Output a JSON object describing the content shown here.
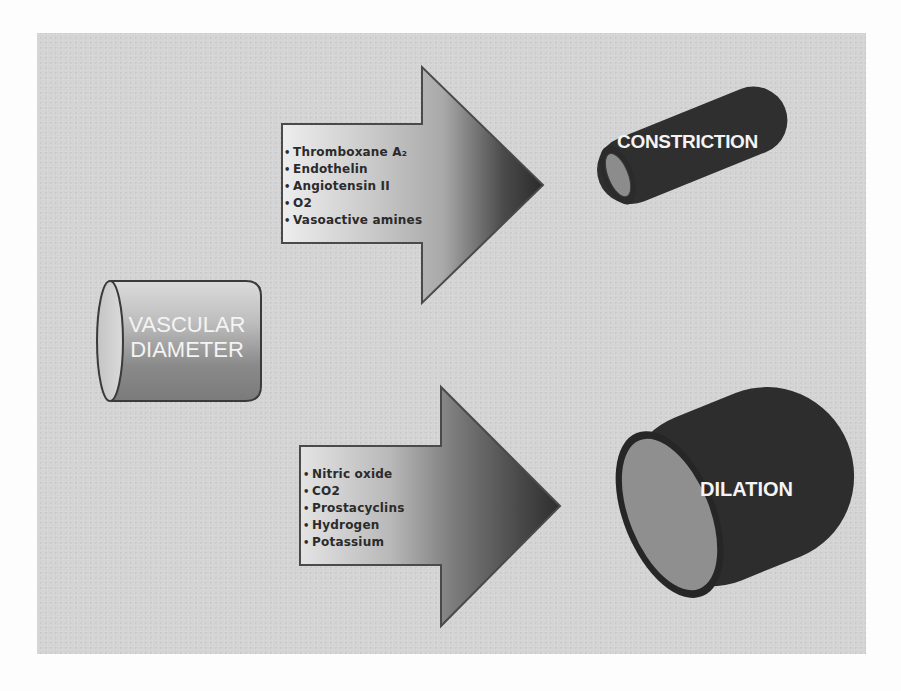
{
  "diagram": {
    "source": {
      "label_line1": "VASCULAR",
      "label_line2": "DIAMETER"
    },
    "constriction": {
      "label": "CONSTRICTION",
      "agents": [
        "Thromboxane A₂",
        "Endothelin",
        "Angiotensin II",
        "O2",
        "Vasoactive amines"
      ]
    },
    "dilation": {
      "label": "DILATION",
      "agents": [
        "Nitric oxide",
        "CO2",
        "Prostacyclins",
        "Hydrogen",
        "Potassium"
      ]
    },
    "colors": {
      "panel_background": "#d4d4d4",
      "page_background": "#fdfdfd",
      "cylinder_dark": "#2f2f2f",
      "cylinder_inner": "#8a8a8a",
      "arrow_light": "#e6e6e6",
      "arrow_dark": "#2e2e2e",
      "label_text": "#f4f4f4",
      "list_text": "#2b2b2b"
    }
  }
}
